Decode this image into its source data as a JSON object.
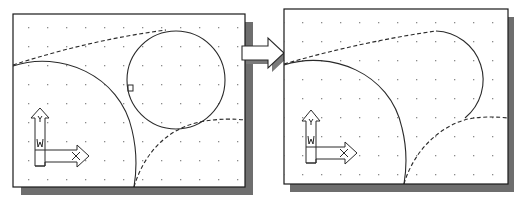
{
  "figure": {
    "colors": {
      "background": "#ffffff",
      "canvas": "#ffffff",
      "border": "#1a1a1a",
      "shadow": "#6e6e6e",
      "grid_dot": "#8a8a8a",
      "geometry": "#2a2a2a"
    },
    "grid": {
      "spacing_px": 19
    },
    "left_panel": {
      "label": "before",
      "elements": [
        "small-circle",
        "large-arc",
        "upper-dashed-tangent-arc",
        "lower-dashed-tangent-arc",
        "pick-box",
        "ucs-icon"
      ]
    },
    "right_panel": {
      "label": "after",
      "elements": [
        "trimmed-circle-arc",
        "large-arc",
        "upper-dashed-tangent-arc",
        "lower-dashed-tangent-arc",
        "ucs-icon"
      ]
    },
    "ucs_icon": {
      "y_label": "Y",
      "x_label": "X",
      "w_label": "W"
    },
    "transition_arrow": {
      "icon": "right-arrow-icon"
    }
  }
}
